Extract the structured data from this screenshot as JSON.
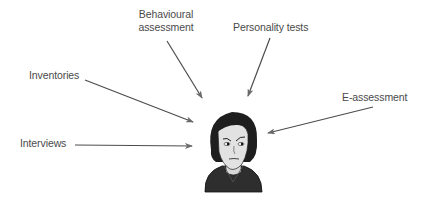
{
  "diagram": {
    "type": "radial-inputs-to-person",
    "center": {
      "name": "person-illustration",
      "description": "cartoon head and shoulders of a person"
    },
    "colors": {
      "text": "#4a4a4a",
      "arrow": "#4d4d4d",
      "hair": "#1e1e1e",
      "skin": "#e2e2e2",
      "clothing": "#2e2e2e"
    },
    "labels": {
      "behavioural_line1": "Behavioural",
      "behavioural_line2": "assessment",
      "personality": "Personality tests",
      "inventories": "Inventories",
      "e_assessment": "E-assessment",
      "interviews": "Interviews"
    },
    "arrows": [
      {
        "from": "Behavioural assessment",
        "to": "person"
      },
      {
        "from": "Personality tests",
        "to": "person"
      },
      {
        "from": "Inventories",
        "to": "person"
      },
      {
        "from": "E-assessment",
        "to": "person"
      },
      {
        "from": "Interviews",
        "to": "person"
      }
    ]
  }
}
